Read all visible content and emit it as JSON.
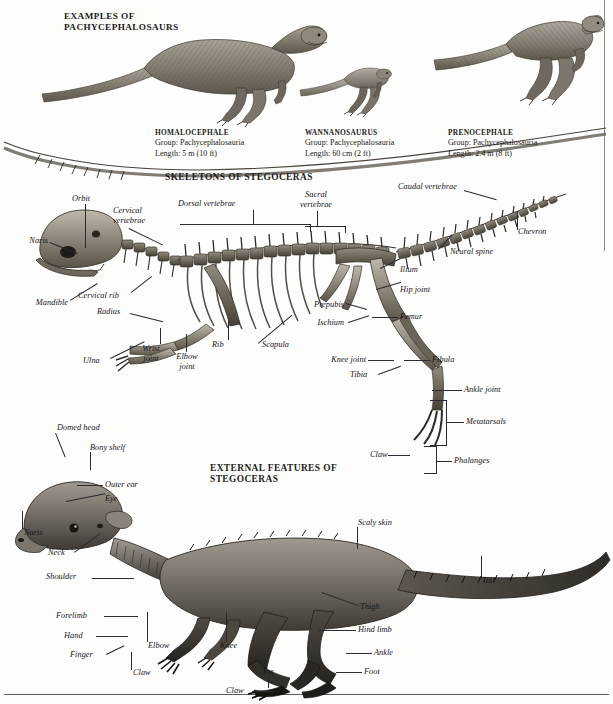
{
  "page": {
    "headings": {
      "examples": "EXAMPLES OF\nPACHYCEPHALOSAURS",
      "skeletons": "SKELETONS OF STEGOCERAS",
      "external": "EXTERNAL FEATURES OF\nSTEGOCERAS"
    }
  },
  "specimens": [
    {
      "name": "HOMALOCEPHALE",
      "group_label": "Group: Pachycephalosauria",
      "length_label": "Length: 5 m (10 ft)"
    },
    {
      "name": "WANNANOSAURUS",
      "group_label": "Group: Pachycephalosauria",
      "length_label": "Length: 60 cm (2 ft)"
    },
    {
      "name": "PRENOCEPHALE",
      "group_label": "Group: Pachycephalosauria",
      "length_label": "Length: 2.4 m (8 ft)"
    }
  ],
  "skeleton_labels": {
    "orbit": "Orbit",
    "naris": "Naris",
    "mandible": "Mandible",
    "cervical_vertebrae": "Cervical\nvertebrae",
    "cervical_rib": "Cervical rib",
    "radius": "Radius",
    "ulna": "Ulna",
    "wrist_joint": "Wrist\njoint",
    "elbow_joint": "Elbow\njoint",
    "rib": "Rib",
    "scapula": "Scapula",
    "dorsal_vertebrae": "Dorsal vertebrae",
    "sacral_vertebrae": "Sacral\nvertebrae",
    "caudal_vertebrae": "Caudal vertebrae",
    "chevron": "Chevron",
    "neural_spine": "Neural spine",
    "ilium": "Ilium",
    "hip_joint": "Hip joint",
    "prepubis": "Prepubis",
    "ischium": "Ischium",
    "femur": "Femur",
    "knee_joint": "Knee joint",
    "tibia": "Tibia",
    "fibula": "Fibula",
    "ankle_joint": "Ankle joint",
    "metatarsals": "Metatarsals",
    "claw": "Claw",
    "phalanges": "Phalanges"
  },
  "external_labels": {
    "domed_head": "Domed head",
    "bony_shelf": "Bony shelf",
    "outer_ear": "Outer ear",
    "eye": "Eye",
    "naris": "Naris",
    "neck": "Neck",
    "shoulder": "Shoulder",
    "forelimb": "Forelimb",
    "hand": "Hand",
    "finger": "Finger",
    "elbow": "Elbow",
    "claw_hand": "Claw",
    "knee": "Knee",
    "thigh": "Thigh",
    "hind_limb": "Hind limb",
    "ankle": "Ankle",
    "foot": "Foot",
    "toe": "Toe",
    "claw_foot": "Claw",
    "scaly_skin": "Scaly skin",
    "tail": "Tail"
  },
  "colors": {
    "ink": "#16161a",
    "leader": "#2a2a30",
    "paper": "#fdfdfb",
    "bone_light": "#b8b2a6",
    "bone_mid": "#8d867a",
    "bone_dark": "#5a5348",
    "skin_light": "#9a948b",
    "skin_mid": "#6e6860",
    "skin_dark": "#3a3631"
  }
}
